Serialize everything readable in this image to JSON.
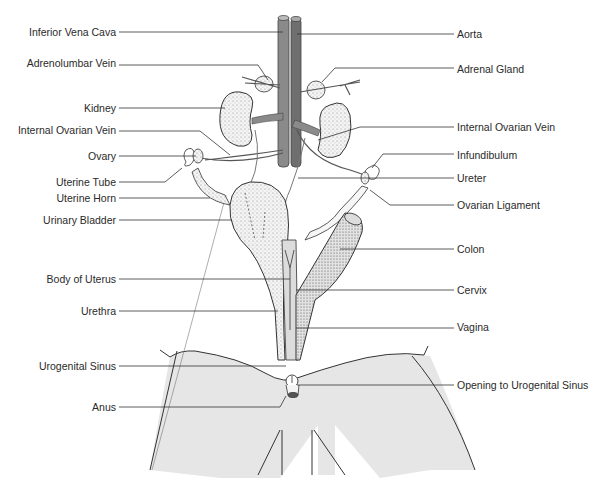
{
  "diagram": {
    "colors": {
      "vena_cava": "#8a8a8a",
      "aorta": "#6f6f6f",
      "body_shading": "#e6e6e6",
      "line": "#333333",
      "organ_fill": "#f2f2f2"
    },
    "labels_left": [
      {
        "id": "inferior-vena-cava",
        "text": "Inferior Vena Cava",
        "y": 32
      },
      {
        "id": "adrenolumbar-vein",
        "text": "Adrenolumbar Vein",
        "y": 62
      },
      {
        "id": "kidney",
        "text": "Kidney",
        "y": 108
      },
      {
        "id": "internal-ovarian-vein-left",
        "text": "Internal Ovarian Vein",
        "y": 130
      },
      {
        "id": "ovary",
        "text": "Ovary",
        "y": 155
      },
      {
        "id": "uterine-tube",
        "text": "Uterine Tube",
        "y": 181
      },
      {
        "id": "uterine-horn",
        "text": "Uterine Horn",
        "y": 197
      },
      {
        "id": "urinary-bladder",
        "text": "Urinary Bladder",
        "y": 219
      },
      {
        "id": "body-of-uterus",
        "text": "Body of Uterus",
        "y": 278
      },
      {
        "id": "urethra",
        "text": "Urethra",
        "y": 310
      },
      {
        "id": "urogenital-sinus",
        "text": "Urogenital Sinus",
        "y": 365
      },
      {
        "id": "anus",
        "text": "Anus",
        "y": 406
      }
    ],
    "labels_right": [
      {
        "id": "aorta",
        "text": "Aorta",
        "y": 34
      },
      {
        "id": "adrenal-gland",
        "text": "Adrenal Gland",
        "y": 69
      },
      {
        "id": "internal-ovarian-vein-right",
        "text": "Internal Ovarian Vein",
        "y": 127
      },
      {
        "id": "infundibulum",
        "text": "Infundibulum",
        "y": 155
      },
      {
        "id": "ureter",
        "text": "Ureter",
        "y": 178
      },
      {
        "id": "ovarian-ligament",
        "text": "Ovarian Ligament",
        "y": 205
      },
      {
        "id": "colon",
        "text": "Colon",
        "y": 249
      },
      {
        "id": "cervix",
        "text": "Cervix",
        "y": 290
      },
      {
        "id": "vagina",
        "text": "Vagina",
        "y": 327
      },
      {
        "id": "opening-to-urogenital-sinus",
        "text": "Opening to Urogenital Sinus",
        "y": 385
      }
    ]
  }
}
